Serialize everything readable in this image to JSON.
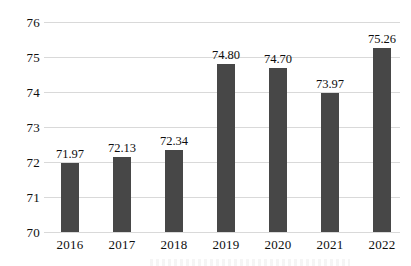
{
  "chart_data": {
    "type": "bar",
    "title": "",
    "subtitle": "",
    "xlabel": "",
    "ylabel": "",
    "categories": [
      "2016",
      "2017",
      "2018",
      "2019",
      "2020",
      "2021",
      "2022"
    ],
    "values": [
      71.97,
      72.13,
      72.34,
      74.8,
      74.7,
      73.97,
      75.26
    ],
    "data_labels": [
      "71.97",
      "72.13",
      "72.34",
      "74.80",
      "74.70",
      "73.97",
      "75.26"
    ],
    "ylim": [
      70,
      76
    ],
    "y_ticks": [
      76,
      75,
      74,
      73,
      72,
      71,
      70
    ],
    "y_tick_labels": [
      "76",
      "75",
      "74",
      "73",
      "72",
      "71",
      "70"
    ],
    "grid": true,
    "grid_axis": "y",
    "legend": false,
    "legend_position": "none",
    "annotations": [],
    "series": [
      {
        "name": "",
        "values": [
          71.97,
          72.13,
          72.34,
          74.8,
          74.7,
          73.97,
          75.26
        ],
        "color": "#474747"
      }
    ]
  },
  "colors": {
    "bar": "#474747",
    "gridline": "#d9d9d9",
    "text": "#0d0d0d",
    "background": "#ffffff"
  }
}
